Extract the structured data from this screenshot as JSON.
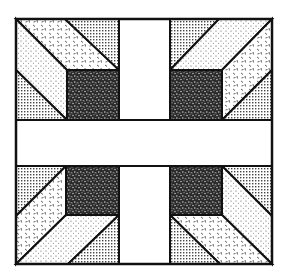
{
  "figure": {
    "title": "Quilt block pattern",
    "colors": {
      "outline": "#111111",
      "background": "#ffffff",
      "dark_fabric": "#333333",
      "light_fabric": "#f2f2f2"
    },
    "fabrics": [
      "dark-speckle",
      "fine-dot",
      "dash-confetti",
      "crosshatch-grid",
      "plain-white"
    ],
    "quadrants": [
      "top-left",
      "top-right",
      "bottom-left",
      "bottom-right"
    ]
  }
}
